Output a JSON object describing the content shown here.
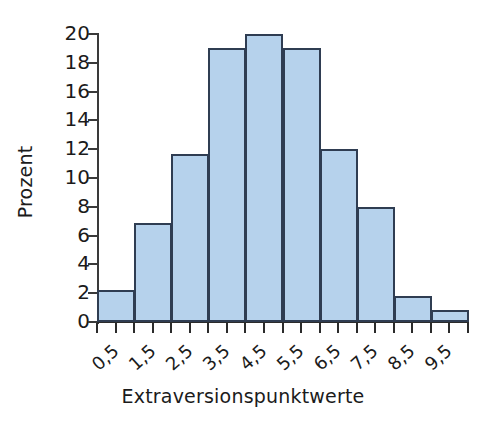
{
  "chart_data": {
    "type": "bar",
    "title": "",
    "subtitle": "",
    "xlabel": "Extraversionspunktwerte",
    "ylabel": "Prozent",
    "categories": [
      "0,5",
      "1,5",
      "2,5",
      "3,5",
      "4,5",
      "5,5",
      "6,5",
      "7,5",
      "8,5",
      "9,5"
    ],
    "values": [
      2.2,
      6.9,
      11.7,
      19.0,
      20.0,
      19.0,
      12.0,
      8.0,
      1.8,
      0.8
    ],
    "ylim": [
      0,
      20
    ],
    "ytick_labels": [
      "0",
      "2",
      "4",
      "6",
      "8",
      "10",
      "12",
      "14",
      "16",
      "18",
      "20"
    ],
    "ytick_values": [
      0,
      2,
      4,
      6,
      8,
      10,
      12,
      14,
      16,
      18,
      20
    ],
    "grid": false,
    "legend": null,
    "legend_position": "none",
    "bar_fill_color": "#b6d2ec",
    "bar_edge_color": "#2f3d52",
    "background_color": "#ffffff",
    "axis_color": "#2b2b2b"
  }
}
